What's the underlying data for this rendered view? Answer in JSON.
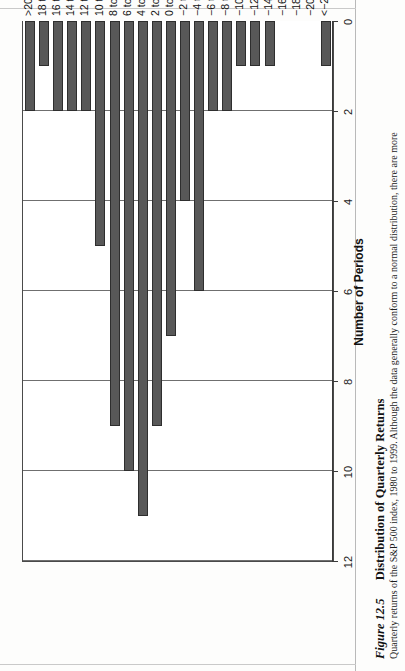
{
  "caption": {
    "figure_number": "Figure 12.5",
    "title": "Distribution of Quarterly Returns",
    "description": "Quarterly returns of the S&P 500 index, 1980 to 1999. Although the data generally conform to a normal distribution, there are more"
  },
  "chart_data": {
    "type": "bar",
    "orientation": "horizontal",
    "title": "Distribution of Quarterly Returns",
    "xlabel": "Percent",
    "ylabel": "Number of Periods",
    "ylim": [
      0,
      12
    ],
    "yticks": [
      "0",
      "2",
      "4",
      "6",
      "8",
      "10",
      "12"
    ],
    "grid": true,
    "legend": false,
    "categories": [
      ">20",
      "18 to 20",
      "16 to 18",
      "14 to 16",
      "12 to 14",
      "10 to 12",
      "8 to 10",
      "6 to 8",
      "4 to 6",
      "2 to 4",
      "0 to 2",
      "−2 to 0",
      "−4 to −2",
      "−6 to −4",
      "−8 to −6",
      "−10 to −8",
      "−12 to −10",
      "−14 to −12",
      "−16 to −14",
      "−18 to −16",
      "−20 to −18",
      "<−20"
    ],
    "values": [
      2,
      1,
      2,
      2,
      2,
      5,
      9,
      10,
      11,
      9,
      7,
      4,
      6,
      2,
      2,
      1,
      1,
      1,
      0,
      0,
      0,
      1
    ],
    "bar_color": "#585858",
    "bar_edge_color": "#2e2e2e"
  }
}
